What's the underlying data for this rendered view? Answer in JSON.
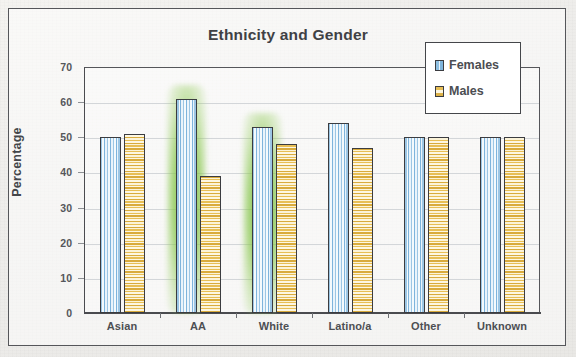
{
  "document": {
    "frame_border_color": "#55565a",
    "background_color": "#efeeeb",
    "ghost_marks": [
      "",
      "",
      "",
      ""
    ]
  },
  "chart_data": {
    "type": "bar",
    "title": "Ethnicity and Gender",
    "xlabel": "",
    "ylabel": "Percentage",
    "categories": [
      "Asian",
      "AA",
      "White",
      "Latino/a",
      "Other",
      "Unknown"
    ],
    "series": [
      {
        "name": "Females",
        "color": "#8fc0e2",
        "values": [
          50,
          61,
          53,
          54,
          50,
          50
        ]
      },
      {
        "name": "Males",
        "color": "#e3ba4e",
        "values": [
          51,
          39,
          48,
          47,
          50,
          50
        ]
      }
    ],
    "ylim": [
      0,
      70
    ],
    "yticks": [
      0,
      10,
      20,
      30,
      40,
      50,
      60,
      70
    ],
    "ytick_labels": [
      "0",
      "10",
      "20",
      "30",
      "40",
      "50",
      "60",
      "70"
    ],
    "grid": true,
    "legend_position": "top-right",
    "highlights": [
      {
        "series": "Females",
        "category": "AA",
        "color": "#7abe42",
        "note": "green highlighter"
      },
      {
        "series": "Females",
        "category": "White",
        "color": "#7abe42",
        "note": "green highlighter"
      }
    ]
  },
  "legend": {
    "entries": [
      {
        "label": "Females",
        "swatch": "females-swatch"
      },
      {
        "label": "Males",
        "swatch": "males-swatch"
      }
    ]
  }
}
